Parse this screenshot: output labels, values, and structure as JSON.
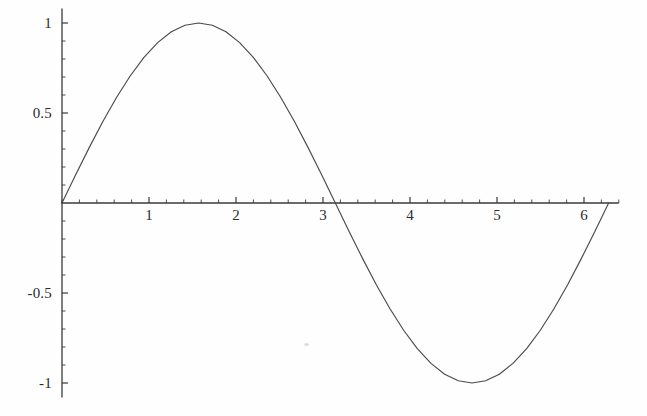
{
  "figure": {
    "type": "plot",
    "background_color": "#fefefe",
    "curve_color": "#4a4a4a",
    "axis_color": "#3a3a3a",
    "label_color": "#2b2b2b"
  },
  "chart_data": {
    "type": "line",
    "title": "",
    "subtitle": "",
    "xlabel": "",
    "ylabel": "",
    "function": "sin(x)",
    "xlim": [
      0,
      6.4
    ],
    "ylim": [
      -1.08,
      1.08
    ],
    "grid": false,
    "legend": null,
    "x_ticks": [
      {
        "value": 1,
        "label": "1"
      },
      {
        "value": 2,
        "label": "2"
      },
      {
        "value": 3,
        "label": "3"
      },
      {
        "value": 4,
        "label": "4"
      },
      {
        "value": 5,
        "label": "5"
      },
      {
        "value": 6,
        "label": "6"
      }
    ],
    "y_ticks": [
      {
        "value": 1,
        "label": "1"
      },
      {
        "value": 0.5,
        "label": "0.5"
      },
      {
        "value": -0.5,
        "label": "-0.5"
      },
      {
        "value": -1,
        "label": "-1"
      }
    ],
    "x_minor_tick_step": 0.2,
    "y_minor_tick_step": 0.1,
    "series": [
      {
        "name": "sin(x)",
        "x": [
          0,
          0.1571,
          0.3142,
          0.4712,
          0.6283,
          0.7854,
          0.9425,
          1.0996,
          1.2566,
          1.4137,
          1.5708,
          1.7279,
          1.885,
          2.042,
          2.1991,
          2.3562,
          2.5133,
          2.6704,
          2.8274,
          2.9845,
          3.1416,
          3.2987,
          3.4558,
          3.6128,
          3.7699,
          3.927,
          4.0841,
          4.2412,
          4.3982,
          4.5553,
          4.7124,
          4.8695,
          5.0265,
          5.1836,
          5.3407,
          5.4978,
          5.6549,
          5.8119,
          5.969,
          6.1261,
          6.2832
        ],
        "y": [
          0,
          0.1564,
          0.309,
          0.454,
          0.5878,
          0.7071,
          0.809,
          0.891,
          0.951,
          0.9877,
          1,
          0.9877,
          0.951,
          0.891,
          0.809,
          0.7071,
          0.5878,
          0.454,
          0.309,
          0.1564,
          0,
          -0.1564,
          -0.309,
          -0.454,
          -0.5878,
          -0.7071,
          -0.809,
          -0.891,
          -0.951,
          -0.9877,
          -1,
          -0.9877,
          -0.951,
          -0.891,
          -0.809,
          -0.7071,
          -0.5878,
          -0.454,
          -0.309,
          -0.1564,
          0
        ]
      }
    ],
    "key_points": {
      "maximum": {
        "x": 1.5708,
        "y": 1
      },
      "minimum": {
        "x": 4.7124,
        "y": -1
      },
      "zero_crossings": [
        0,
        3.1416,
        6.2832
      ]
    }
  }
}
